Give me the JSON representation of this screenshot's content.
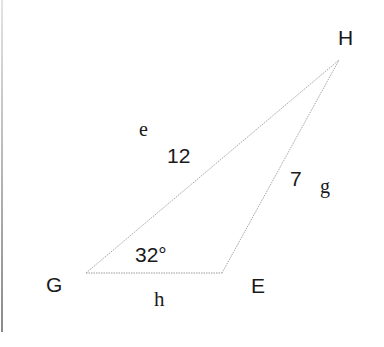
{
  "diagram": {
    "type": "triangle",
    "vertices": [
      {
        "name": "G",
        "x": 86,
        "y": 273,
        "label_x": 58,
        "label_y": 292
      },
      {
        "name": "E",
        "x": 222,
        "y": 273,
        "label_x": 252,
        "label_y": 293
      },
      {
        "name": "H",
        "x": 339,
        "y": 60,
        "label_x": 338,
        "label_y": 45
      }
    ],
    "sides": [
      {
        "name": "e",
        "endpoints": "G-H",
        "length": "12",
        "style": "dotted"
      },
      {
        "name": "g",
        "endpoints": "E-H",
        "length": "7",
        "style": "dotted"
      },
      {
        "name": "h",
        "endpoints": "G-E",
        "length": "",
        "style": "dotted"
      }
    ],
    "angle": {
      "vertex": "G",
      "value": "32°"
    },
    "labels": {
      "vertex_G": "G",
      "vertex_E": "E",
      "vertex_H": "H",
      "side_e": "e",
      "side_g": "g",
      "side_h": "h",
      "length_e": "12",
      "length_g": "7",
      "angle_G": "32°"
    },
    "line_color": "#9a9a9a",
    "text_color": "#1a1a1a"
  }
}
